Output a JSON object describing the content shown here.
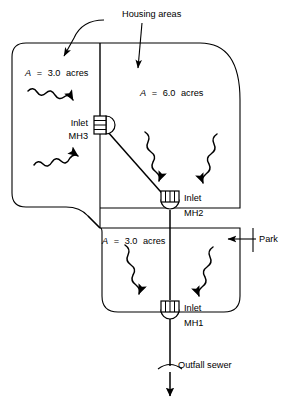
{
  "figure": {
    "type": "engineering-schematic",
    "background_color": "#ffffff",
    "line_color": "#000000",
    "width": 292,
    "height": 406
  },
  "annotations": {
    "housing_areas_label": "Housing areas",
    "park_label": "Park",
    "outfall_label": "Outfall sewer"
  },
  "areas": [
    {
      "id": "area-upper-left",
      "symbol": "A",
      "equals": "=",
      "value": "3.0",
      "units": "acres",
      "full_label": "A = 3.0 acres",
      "land_use": "Housing areas",
      "drains_to": "MH3"
    },
    {
      "id": "area-upper-right",
      "symbol": "A",
      "equals": "=",
      "value": "6.0",
      "units": "acres",
      "full_label": "A = 6.0 acres",
      "land_use": "Housing areas",
      "drains_to": "MH2"
    },
    {
      "id": "area-lower",
      "symbol": "A",
      "equals": "=",
      "value": "3.0",
      "units": "acres",
      "full_label": "A = 3.0 acres",
      "land_use": "Park",
      "drains_to": "MH1"
    }
  ],
  "inlets": [
    {
      "id": "mh3",
      "type_label": "Inlet",
      "name_label": "MH3",
      "hatch": "horizontal",
      "bowl_side": "right"
    },
    {
      "id": "mh2",
      "type_label": "Inlet",
      "name_label": "MH2",
      "hatch": "vertical",
      "bowl_side": "bottom"
    },
    {
      "id": "mh1",
      "type_label": "Inlet",
      "name_label": "MH1",
      "hatch": "vertical",
      "bowl_side": "bottom"
    }
  ]
}
